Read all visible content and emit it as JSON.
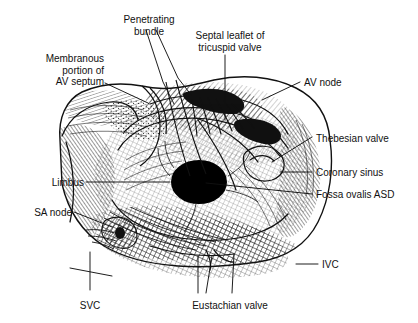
{
  "figure": {
    "type": "medical-line-illustration",
    "style": "black-and-white pen-and-ink cross-hatched engraving",
    "background_color": "#ffffff",
    "ink_color": "#111111",
    "canvas": {
      "width": 418,
      "height": 323
    }
  },
  "labels": [
    {
      "id": "penetrating-bundle",
      "text": "Penetrating\nbundle",
      "align": "center",
      "x": 110,
      "y": 14,
      "width": 78
    },
    {
      "id": "septal-leaflet",
      "text": "Septal leaflet of\ntricuspid valve",
      "align": "center",
      "x": 182,
      "y": 30,
      "width": 96
    },
    {
      "id": "membranous-portion",
      "text": "Membranous\nportion of\nAV septum",
      "align": "right",
      "x": 18,
      "y": 53,
      "width": 86
    },
    {
      "id": "av-node",
      "text": "AV node",
      "align": "left",
      "x": 304,
      "y": 77,
      "width": 60
    },
    {
      "id": "thebesian-valve",
      "text": "Thebesian valve",
      "align": "left",
      "x": 316,
      "y": 133,
      "width": 90
    },
    {
      "id": "limbus",
      "text": "Limbus",
      "align": "right",
      "x": 30,
      "y": 177,
      "width": 54
    },
    {
      "id": "coronary-sinus",
      "text": "Coronary sinus",
      "align": "left",
      "x": 316,
      "y": 167,
      "width": 88
    },
    {
      "id": "fossa-ovalis-asd",
      "text": "Fossa ovalis ASD",
      "align": "left",
      "x": 316,
      "y": 189,
      "width": 96
    },
    {
      "id": "sa-node",
      "text": "SA node",
      "align": "right",
      "x": 12,
      "y": 207,
      "width": 60
    },
    {
      "id": "ivc",
      "text": "IVC",
      "align": "left",
      "x": 322,
      "y": 259,
      "width": 30
    },
    {
      "id": "svc",
      "text": "SVC",
      "align": "center",
      "x": 73,
      "y": 300,
      "width": 34
    },
    {
      "id": "eustachian-valve",
      "text": "Eustachian valve",
      "align": "center",
      "x": 180,
      "y": 300,
      "width": 100
    }
  ],
  "leader_lines": [
    {
      "id": "leader-penetrating-bundle-a",
      "points": "146,30 163,82 174,104"
    },
    {
      "id": "leader-penetrating-bundle-b",
      "points": "156,30 178,78 192,96"
    },
    {
      "id": "leader-septal-leaflet",
      "points": "225,55 225,120"
    },
    {
      "id": "leader-membranous-portion",
      "points": "105,83 148,103"
    },
    {
      "id": "leader-av-node",
      "points": "300,82 262,100"
    },
    {
      "id": "leader-thebesian-valve",
      "points": "312,137 272,162"
    },
    {
      "id": "leader-limbus",
      "points": "86,182 170,182"
    },
    {
      "id": "leader-coronary-sinus",
      "points": "312,172 280,172"
    },
    {
      "id": "leader-fossa-ovalis-asd",
      "points": "312,194 206,183"
    },
    {
      "id": "leader-sa-node",
      "points": "74,212 112,227"
    },
    {
      "id": "leader-ivc",
      "points": "318,264 296,264"
    },
    {
      "id": "leader-svc",
      "points": "90,290 90,252"
    },
    {
      "id": "leader-svc-cross",
      "points": "70,268 112,276"
    },
    {
      "id": "leader-eustachian-a",
      "points": "198,293 198,256"
    },
    {
      "id": "leader-eustachian-b",
      "points": "206,293 212,256"
    },
    {
      "id": "leader-eustachian-c",
      "points": "232,293 234,254"
    }
  ],
  "anatomy": {
    "fossa_ovalis_defect": {
      "shape": "ellipse",
      "fill": "#000000",
      "cx": 199,
      "cy": 182,
      "rx": 27,
      "ry": 21
    },
    "structures": [
      "membranous portion of AV septum",
      "penetrating bundle",
      "septal leaflet of tricuspid valve",
      "AV node",
      "Thebesian valve",
      "coronary sinus ostium",
      "fossa ovalis atrial septal defect",
      "limbus of fossa ovalis",
      "SA node",
      "superior vena cava",
      "inferior vena cava",
      "Eustachian valve"
    ]
  }
}
